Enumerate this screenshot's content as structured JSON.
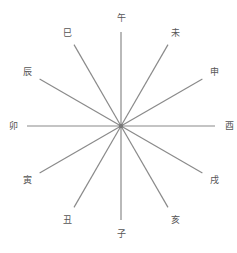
{
  "diagram": {
    "center": [
      121,
      126
    ],
    "radius": 94,
    "label_radius": 108,
    "line_color": "#8a8a8a",
    "branches": [
      {
        "label": "午",
        "angle": 0
      },
      {
        "label": "未",
        "angle": 30
      },
      {
        "label": "申",
        "angle": 60
      },
      {
        "label": "酉",
        "angle": 90
      },
      {
        "label": "戌",
        "angle": 120
      },
      {
        "label": "亥",
        "angle": 150
      },
      {
        "label": "子",
        "angle": 180
      },
      {
        "label": "丑",
        "angle": 210
      },
      {
        "label": "寅",
        "angle": 240
      },
      {
        "label": "卯",
        "angle": 270
      },
      {
        "label": "辰",
        "angle": 300
      },
      {
        "label": "巳",
        "angle": 330
      }
    ]
  }
}
